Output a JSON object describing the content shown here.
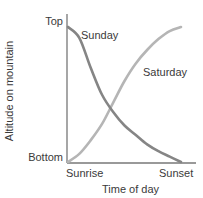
{
  "chart_data": {
    "type": "line",
    "title": "",
    "xlabel": "Time of day",
    "ylabel": "Altitude on mountain",
    "x_ticks": [
      "Sunrise",
      "Sunset"
    ],
    "y_ticks": [
      "Bottom",
      "Top"
    ],
    "x": [
      0,
      0.1,
      0.2,
      0.3,
      0.4,
      0.5,
      0.6,
      0.7,
      0.8,
      0.9,
      1.0
    ],
    "series": [
      {
        "name": "Sunday",
        "color": "#858585",
        "values": [
          1.0,
          0.92,
          0.7,
          0.5,
          0.37,
          0.27,
          0.2,
          0.13,
          0.08,
          0.04,
          0.0
        ]
      },
      {
        "name": "Saturday",
        "color": "#b5b5b5",
        "values": [
          0.0,
          0.06,
          0.16,
          0.28,
          0.44,
          0.6,
          0.73,
          0.83,
          0.91,
          0.97,
          1.0
        ]
      }
    ],
    "xlim": [
      0,
      1
    ],
    "ylim": [
      0,
      1
    ],
    "grid": false,
    "legend": "inline labels"
  },
  "labels": {
    "y_top": "Top",
    "y_bottom": "Bottom",
    "x_left": "Sunrise",
    "x_right": "Sunset",
    "x_title": "Time of day",
    "y_title": "Altitude on mountain",
    "series_sunday": "Sunday",
    "series_saturday": "Saturday"
  },
  "colors": {
    "axis": "#777777",
    "sunday": "#858585",
    "saturday": "#b5b5b5"
  }
}
